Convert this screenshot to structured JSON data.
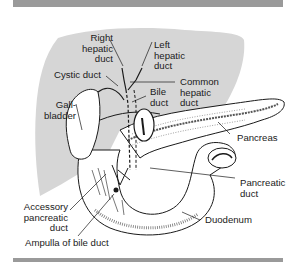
{
  "figure": {
    "colors": {
      "liver_fill": "#d6d6d6",
      "bar": "#9a9a9a",
      "line": "#1a1a1a",
      "background": "#ffffff"
    },
    "labels": {
      "right_hepatic_duct": [
        "Right",
        "hepatic",
        "duct"
      ],
      "left_hepatic_duct": [
        "Left",
        "hepatic",
        "duct"
      ],
      "cystic_duct": "Cystic duct",
      "common_hepatic_duct": [
        "Common",
        "hepatic",
        "duct"
      ],
      "bile_duct": [
        "Bile",
        "duct"
      ],
      "gallbladder": [
        "Gall-",
        "bladder"
      ],
      "pancreas": "Pancreas",
      "pancreatic_duct": [
        "Pancreatic",
        "duct"
      ],
      "accessory_pancreatic_duct": [
        "Accessory",
        "pancreatic",
        "duct"
      ],
      "duodenum": "Duodenum",
      "ampulla_of_bile_duct": "Ampulla of bile duct"
    }
  }
}
